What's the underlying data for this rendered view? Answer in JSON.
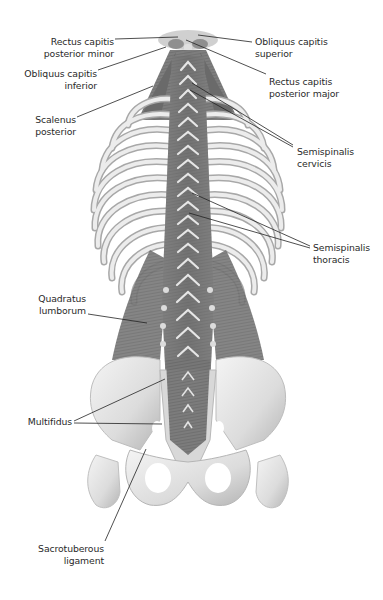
{
  "figure": {
    "colors": {
      "background": "#ffffff",
      "bone_light": "#e9e9e9",
      "bone_mid": "#cfcfcf",
      "bone_shadow": "#9a9a9a",
      "muscle": "#7a7a7a",
      "muscle_dark": "#5a5a5a",
      "label_text": "#2a2a2a",
      "leader_line": "#222222"
    }
  },
  "labels": [
    {
      "id": "rectus-capitis-posterior-minor",
      "text": "Rectus capitis\nposterior minor",
      "x": 8,
      "y": 36,
      "w": 106,
      "align": "right",
      "lines": [
        [
          115,
          39,
          178,
          37
        ]
      ]
    },
    {
      "id": "obliquus-capitis-superior",
      "text": "Obliquus capitis\nsuperior",
      "x": 255,
      "y": 36,
      "w": 110,
      "align": "left",
      "lines": [
        [
          198,
          35,
          252,
          42
        ]
      ]
    },
    {
      "id": "obliquus-capitis-inferior",
      "text": "Obliquus capitis\ninferior",
      "x": 2,
      "y": 68,
      "w": 95,
      "align": "right",
      "lines": [
        [
          98,
          70,
          166,
          47
        ]
      ]
    },
    {
      "id": "rectus-capitis-posterior-major",
      "text": "Rectus capitis\nposterior major",
      "x": 269,
      "y": 76,
      "w": 110,
      "align": "left",
      "lines": [
        [
          186,
          40,
          266,
          74
        ]
      ]
    },
    {
      "id": "scalenus-posterior",
      "text": "Scalenus\nposterior",
      "x": 20,
      "y": 114,
      "w": 56,
      "align": "right",
      "lines": [
        [
          77,
          117,
          153,
          86
        ]
      ]
    },
    {
      "id": "semispinalis-cervicis",
      "text": "Semispinalis\ncervicis",
      "x": 297,
      "y": 146,
      "w": 85,
      "align": "left",
      "lines": [
        [
          192,
          83,
          293,
          145
        ],
        [
          190,
          90,
          293,
          147
        ]
      ]
    },
    {
      "id": "semispinalis-thoracis",
      "text": "Semispinalis\nthoracis",
      "x": 313,
      "y": 242,
      "w": 70,
      "align": "left",
      "lines": [
        [
          192,
          193,
          310,
          246
        ],
        [
          189,
          213,
          310,
          248
        ]
      ]
    },
    {
      "id": "quadratus-lumborum",
      "text": "Quadratus\nlumborum",
      "x": 20,
      "y": 293,
      "w": 66,
      "align": "right",
      "lines": [
        [
          88,
          314,
          147,
          323
        ]
      ]
    },
    {
      "id": "multifidus",
      "text": "Multifidus",
      "x": 10,
      "y": 416,
      "w": 62,
      "align": "right",
      "lines": [
        [
          74,
          421,
          165,
          379
        ],
        [
          74,
          423,
          162,
          424
        ]
      ]
    },
    {
      "id": "sacrotuberous-ligament",
      "text": "Sacrotuberous\nligament",
      "x": 18,
      "y": 543,
      "w": 86,
      "align": "right",
      "lines": [
        [
          105,
          541,
          146,
          449
        ]
      ]
    }
  ]
}
